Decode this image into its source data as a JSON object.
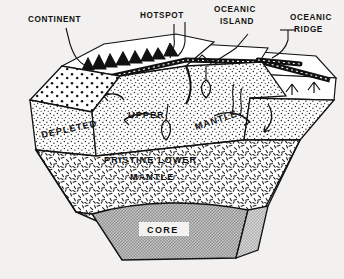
{
  "figure": {
    "background_color": "#f2f1ef",
    "ink_color": "#111111",
    "core_fill": "#9a9a9a",
    "core_side_fill": "#b4b4b4"
  },
  "callouts": [
    {
      "id": "continent",
      "label_line1": "CONTINENT",
      "label_line2": ""
    },
    {
      "id": "hotspot",
      "label_line1": "HOTSPOT",
      "label_line2": ""
    },
    {
      "id": "oceanic-island",
      "label_line1": "OCEANIC",
      "label_line2": "ISLAND"
    },
    {
      "id": "oceanic-ridge",
      "label_line1": "OCEANIC",
      "label_line2": "RIDGE"
    }
  ],
  "layers": [
    {
      "id": "depleted-upper-mantle",
      "words": [
        "DEPLETED",
        "UPPER",
        "MANTLE"
      ]
    },
    {
      "id": "pristine-lower-mantle",
      "line1": "PRISTINE  LOWER",
      "line2": "MANTLE"
    },
    {
      "id": "core",
      "label": "CORE"
    }
  ],
  "inner_labels": {
    "depleted": "DEPLETED",
    "upper": "UPPER",
    "mantle": "MANTLE",
    "pristine_lower": "PRISTINE  LOWER",
    "lower_mantle": "MANTLE",
    "core": "CORE"
  }
}
